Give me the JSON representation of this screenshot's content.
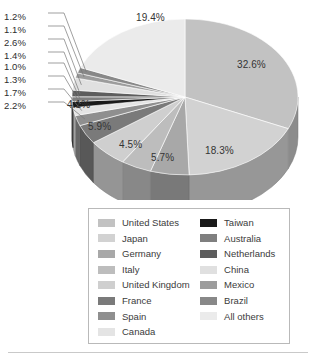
{
  "chart_data": {
    "type": "pie",
    "title": "",
    "subtitle": "",
    "xlabel": "",
    "ylabel": "",
    "three_d": true,
    "grid": false,
    "legend_position": "bottom",
    "legend_columns": 2,
    "value_suffix": "%",
    "categories": [
      "United States",
      "Japan",
      "Germany",
      "Italy",
      "United Kingdom",
      "France",
      "Spain",
      "Canada",
      "Taiwan",
      "Australia",
      "Netherlands",
      "China",
      "Mexico",
      "Brazil",
      "All others"
    ],
    "values": [
      32.6,
      18.3,
      5.7,
      4.5,
      5.9,
      4.1,
      2.2,
      1.7,
      1.3,
      1.0,
      1.4,
      2.6,
      1.1,
      1.2,
      19.4
    ],
    "labels": [
      "32.6%",
      "18.3%",
      "5.7%",
      "4.5%",
      "5.9%",
      "4.1%",
      "2.2%",
      "1.7%",
      "1.3%",
      "1.0%",
      "1.4%",
      "2.6%",
      "1.1%",
      "1.2%",
      "19.4%"
    ],
    "colors": [
      "#c2c2c2",
      "#d2d2d2",
      "#a8a8a8",
      "#bdbdbd",
      "#cfcfcf",
      "#7a7a7a",
      "#8f8f8f",
      "#e4e4e4",
      "#1a1a1a",
      "#7f7f7f",
      "#5d5d5d",
      "#e0e0e0",
      "#9c9c9c",
      "#888888",
      "#ebebeb"
    ],
    "slices": [
      {
        "label": "32.6%",
        "value": 32.6,
        "category": "United States",
        "color": "#c2c2c2"
      },
      {
        "label": "18.3%",
        "value": 18.3,
        "category": "Japan",
        "color": "#d2d2d2"
      },
      {
        "label": "5.7%",
        "value": 5.7,
        "category": "Germany",
        "color": "#a8a8a8"
      },
      {
        "label": "4.5%",
        "value": 4.5,
        "category": "Italy",
        "color": "#bdbdbd"
      },
      {
        "label": "5.9%",
        "value": 5.9,
        "category": "United Kingdom",
        "color": "#cfcfcf"
      },
      {
        "label": "4.1%",
        "value": 4.1,
        "category": "France",
        "color": "#7a7a7a"
      },
      {
        "label": "2.2%",
        "value": 2.2,
        "category": "Spain",
        "color": "#8f8f8f"
      },
      {
        "label": "1.7%",
        "value": 1.7,
        "category": "Canada",
        "color": "#e4e4e4"
      },
      {
        "label": "1.3%",
        "value": 1.3,
        "category": "Taiwan",
        "color": "#1a1a1a"
      },
      {
        "label": "1.0%",
        "value": 1.0,
        "category": "Australia",
        "color": "#7f7f7f"
      },
      {
        "label": "1.4%",
        "value": 1.4,
        "category": "Netherlands",
        "color": "#5d5d5d"
      },
      {
        "label": "2.6%",
        "value": 2.6,
        "category": "China",
        "color": "#e0e0e0"
      },
      {
        "label": "1.1%",
        "value": 1.1,
        "category": "Mexico",
        "color": "#9c9c9c"
      },
      {
        "label": "1.2%",
        "value": 1.2,
        "category": "Brazil",
        "color": "#888888"
      },
      {
        "label": "19.4%",
        "value": 19.4,
        "category": "All others",
        "color": "#ebebeb"
      }
    ]
  },
  "legend": {
    "left_column": [
      {
        "label": "United States",
        "color": "#c2c2c2"
      },
      {
        "label": "Japan",
        "color": "#d2d2d2"
      },
      {
        "label": "Germany",
        "color": "#a8a8a8"
      },
      {
        "label": "Italy",
        "color": "#bdbdbd"
      },
      {
        "label": "United Kingdom",
        "color": "#cfcfcf"
      },
      {
        "label": "France",
        "color": "#7a7a7a"
      },
      {
        "label": "Spain",
        "color": "#8f8f8f"
      },
      {
        "label": "Canada",
        "color": "#e4e4e4"
      }
    ],
    "right_column": [
      {
        "label": "Taiwan",
        "color": "#1a1a1a"
      },
      {
        "label": "Australia",
        "color": "#7f7f7f"
      },
      {
        "label": "Netherlands",
        "color": "#5d5d5d"
      },
      {
        "label": "China",
        "color": "#e0e0e0"
      },
      {
        "label": "Mexico",
        "color": "#9c9c9c"
      },
      {
        "label": "Brazil",
        "color": "#888888"
      },
      {
        "label": "All others",
        "color": "#ebebeb"
      }
    ]
  },
  "callout_labels": [
    {
      "label": "1.2%",
      "category": "Brazil"
    },
    {
      "label": "1.1%",
      "category": "Mexico"
    },
    {
      "label": "2.6%",
      "category": "China"
    },
    {
      "label": "1.4%",
      "category": "Netherlands"
    },
    {
      "label": "1.0%",
      "category": "Australia"
    },
    {
      "label": "1.3%",
      "category": "Taiwan"
    },
    {
      "label": "1.7%",
      "category": "Canada"
    },
    {
      "label": "2.2%",
      "category": "Spain"
    }
  ],
  "inner_labels": [
    {
      "label": "19.4%",
      "category": "All others"
    },
    {
      "label": "32.6%",
      "category": "United States"
    },
    {
      "label": "18.3%",
      "category": "Japan"
    },
    {
      "label": "5.7%",
      "category": "Germany"
    },
    {
      "label": "4.5%",
      "category": "Italy"
    },
    {
      "label": "5.9%",
      "category": "United Kingdom"
    },
    {
      "label": "4.1%",
      "category": "France"
    }
  ]
}
